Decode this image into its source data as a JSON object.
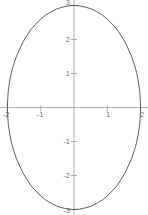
{
  "chart_data": {
    "type": "line",
    "title": "",
    "subtitle": "",
    "xlabel": "",
    "ylabel": "",
    "curve_name": "ellipse",
    "equation": "x^2/4 + y^2/9 = 1",
    "semi_axis_x": 2,
    "semi_axis_y": 3,
    "center": [
      0,
      0
    ],
    "xlim": [
      -2.1,
      2.1
    ],
    "ylim": [
      -3.15,
      3.15
    ],
    "grid": false,
    "legend": "none",
    "axes_style": "centered-crosshair",
    "x_ticks": [
      -2,
      -1,
      1,
      2
    ],
    "x_tick_labels": [
      "-2",
      "-1",
      "1",
      "2"
    ],
    "y_ticks": [
      3,
      2,
      1,
      -1,
      -2,
      -3
    ],
    "y_tick_labels": [
      "3",
      "2",
      "1",
      "-1",
      "-2",
      "-3"
    ],
    "colors": {
      "curve": "#4d4d4d",
      "axis": "#9a9a9a",
      "tick_label": "#6e6e6e",
      "background": "#ffffff"
    },
    "x": [
      2.0,
      1.99,
      1.97,
      1.93,
      1.88,
      1.81,
      1.73,
      1.63,
      1.53,
      1.41,
      1.29,
      1.15,
      1.0,
      0.85,
      0.68,
      0.52,
      0.35,
      0.17,
      0.0,
      -0.17,
      -0.35,
      -0.52,
      -0.68,
      -0.85,
      -1.0,
      -1.15,
      -1.29,
      -1.41,
      -1.53,
      -1.63,
      -1.73,
      -1.81,
      -1.88,
      -1.93,
      -1.97,
      -1.99,
      -2.0
    ],
    "y": [
      0.0,
      0.26,
      0.52,
      0.78,
      1.03,
      1.27,
      1.5,
      1.72,
      1.93,
      2.12,
      2.3,
      2.45,
      2.6,
      2.72,
      2.82,
      2.9,
      2.95,
      2.99,
      3.0,
      2.99,
      2.95,
      2.9,
      2.82,
      2.72,
      2.6,
      2.45,
      2.3,
      2.12,
      1.93,
      1.72,
      1.5,
      1.27,
      1.03,
      0.78,
      0.52,
      0.26,
      0.0
    ]
  }
}
